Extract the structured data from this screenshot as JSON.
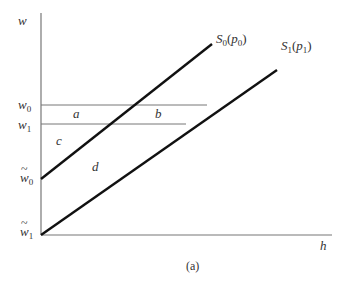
{
  "figure": {
    "caption": "(a)",
    "axes": {
      "y_label": "w",
      "x_label": "h"
    },
    "y_ticks": [
      {
        "base": "w",
        "sub": "0",
        "tilde": false
      },
      {
        "base": "w",
        "sub": "1",
        "tilde": false
      },
      {
        "base": "w",
        "sub": "0",
        "tilde": true
      },
      {
        "base": "w",
        "sub": "1",
        "tilde": true
      }
    ],
    "curves": [
      {
        "name": "S",
        "sub": "0",
        "arg": "p",
        "arg_sub": "0"
      },
      {
        "name": "S",
        "sub": "1",
        "arg": "p",
        "arg_sub": "1"
      }
    ],
    "regions": [
      "a",
      "b",
      "c",
      "d"
    ],
    "colors": {
      "lines": "#111111",
      "axes": "#666666",
      "text": "#333333"
    }
  }
}
